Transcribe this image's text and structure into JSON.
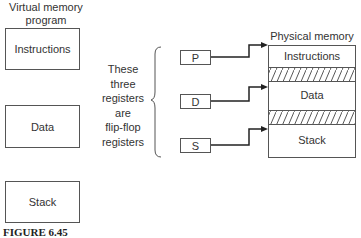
{
  "virtual": {
    "title_line1": "Virtual memory",
    "title_line2": "program",
    "segments": [
      "Instructions",
      "Data",
      "Stack"
    ]
  },
  "note": {
    "lines": [
      "These",
      "three",
      "registers",
      "are",
      "flip-flop",
      "registers"
    ]
  },
  "registers": [
    "P",
    "D",
    "S"
  ],
  "physical": {
    "title": "Physical memory",
    "segments": [
      "Instructions",
      "Data",
      "Stack"
    ]
  },
  "caption": "FIGURE 6.45"
}
